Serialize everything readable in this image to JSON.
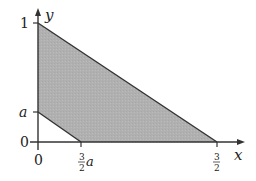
{
  "diagram": {
    "type": "shaded-region-plot",
    "axes": {
      "x_label": "x",
      "y_label": "y"
    },
    "ticks": {
      "y_one": "1",
      "y_a": "a",
      "y_zero": "0",
      "x_zero": "0",
      "x_three_halves_a_num": "3",
      "x_three_halves_a_den": "2",
      "x_three_halves_a_var": "a",
      "x_three_halves_num": "3",
      "x_three_halves_den": "2"
    },
    "region": {
      "description": "Area between line from (0,1) to (3/2,0) and line from (0,a) to (3/2 a,0), in first quadrant",
      "vertices": [
        [
          "0",
          "1"
        ],
        [
          "3/2",
          "0"
        ],
        [
          "3/2 a",
          "0"
        ],
        [
          "0",
          "a"
        ]
      ],
      "fill_color": "#b3b3b3",
      "edge_color": "#333333"
    }
  }
}
